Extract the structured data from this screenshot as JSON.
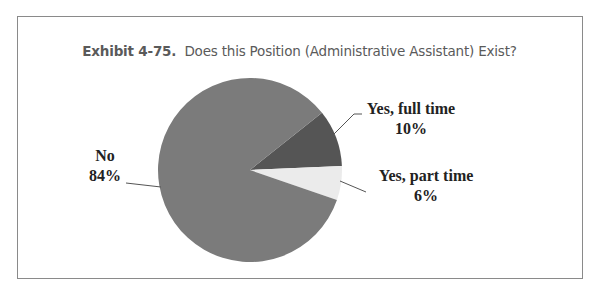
{
  "title": {
    "prefix": "Exhibit 4-75.",
    "text": "Does this Position (Administrative Assistant) Exist?"
  },
  "chart_data": {
    "type": "pie",
    "categories": [
      "Yes, full time",
      "Yes, part time",
      "No"
    ],
    "values": [
      10,
      6,
      84
    ],
    "value_labels": [
      "10%",
      "6%",
      "84%"
    ],
    "colors": [
      "#555555",
      "#ebebeb",
      "#7b7b7b"
    ],
    "legend": "none (data labels with leader lines)"
  },
  "labels": {
    "full_time": {
      "name": "Yes, full time",
      "pct": "10%"
    },
    "part_time": {
      "name": "Yes, part time",
      "pct": "6%"
    },
    "no": {
      "name": "No",
      "pct": "84%"
    }
  }
}
